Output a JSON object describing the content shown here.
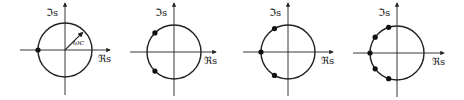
{
  "figure": {
    "axis_labels": {
      "real": "ℜs",
      "imag": "ℑs"
    },
    "radius_label": "ωc",
    "panels": [
      {
        "id": "order-1",
        "order": 1,
        "show_radius": true,
        "pole_angles_deg": [
          180
        ]
      },
      {
        "id": "order-2",
        "order": 2,
        "show_radius": false,
        "pole_angles_deg": [
          135,
          225
        ]
      },
      {
        "id": "order-3",
        "order": 3,
        "show_radius": false,
        "pole_angles_deg": [
          120,
          180,
          240
        ]
      },
      {
        "id": "order-4",
        "order": 4,
        "show_radius": false,
        "pole_angles_deg": [
          108,
          144,
          180,
          216,
          252
        ]
      }
    ]
  }
}
